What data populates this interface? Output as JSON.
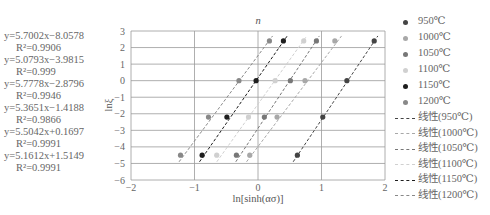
{
  "chart_data": {
    "type": "scatter",
    "title": "n",
    "xlabel": "ln[sinh(ασ)]",
    "ylabel": "lnξ",
    "xlim": [
      -2,
      2
    ],
    "ylim": [
      -6,
      3
    ],
    "xticks": [
      "-2",
      "-1",
      "0",
      "1",
      "2"
    ],
    "yticks": [
      "3",
      "2",
      "1",
      "0",
      "-1",
      "-2",
      "-3",
      "-4",
      "-5",
      "-6"
    ],
    "grid": true,
    "legend_position": "right",
    "series": [
      {
        "name": "950℃",
        "color": "#444444",
        "x": [
          0.62,
          1.02,
          1.4,
          1.83
        ],
        "y": [
          -4.5,
          -2.2,
          0.0,
          2.4
        ],
        "fit": {
          "label": "线性(950℃)",
          "slope": 5.7002,
          "intercept": -8.0578,
          "equation": "y=5.7002x−8.0578",
          "r2": "R²=0.9906"
        }
      },
      {
        "name": "1000℃",
        "color": "#a8a8a8",
        "x": [
          -0.13,
          0.3,
          0.74,
          1.21
        ],
        "y": [
          -4.5,
          -2.2,
          0.0,
          2.4
        ],
        "fit": {
          "label": "线性(1000℃)",
          "slope": 5.0793,
          "intercept": -3.9815,
          "equation": "y=5.0793x−3.9815",
          "r2": "R²=0.999"
        }
      },
      {
        "name": "1050℃",
        "color": "#777777",
        "x": [
          -0.34,
          0.1,
          0.51,
          0.92
        ],
        "y": [
          -4.5,
          -2.2,
          0.0,
          2.4
        ],
        "fit": {
          "label": "线性(1050℃)",
          "slope": 5.7778,
          "intercept": -2.8796,
          "equation": "y=5.7778x−2.8796",
          "r2": "R²=0.9946"
        }
      },
      {
        "name": "1100℃",
        "color": "#d0d0d0",
        "x": [
          -0.65,
          -0.15,
          0.27,
          0.72
        ],
        "y": [
          -4.5,
          -2.2,
          0.0,
          2.4
        ],
        "fit": {
          "label": "线性(1100℃)",
          "slope": 5.3651,
          "intercept": -1.4188,
          "equation": "y=5.3651x−1.4188",
          "r2": "R²=0.9866"
        }
      },
      {
        "name": "1150℃",
        "color": "#1e1e1e",
        "x": [
          -0.88,
          -0.49,
          -0.03,
          0.4
        ],
        "y": [
          -4.5,
          -2.2,
          0.0,
          2.4
        ],
        "fit": {
          "label": "线性(1150℃)",
          "slope": 5.5042,
          "intercept": 0.1697,
          "equation": "y=5.5042x+0.1697",
          "r2": "R²=0.9991"
        }
      },
      {
        "name": "1200℃",
        "color": "#888888",
        "x": [
          -1.22,
          -0.78,
          -0.3,
          0.18
        ],
        "y": [
          -4.5,
          -2.2,
          0.0,
          2.4
        ],
        "fit": {
          "label": "线性(1200℃)",
          "slope": 5.1612,
          "intercept": 1.5149,
          "equation": "y=5.1612x+1.5149",
          "r2": "R²=0.9991"
        }
      }
    ]
  }
}
